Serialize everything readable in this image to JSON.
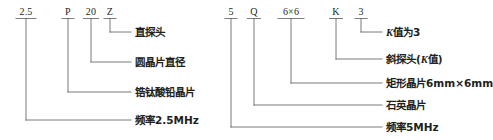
{
  "figure": {
    "type": "ultrasonic-probe-model-designation-diagram",
    "background_color": "#ffffff",
    "line_color": "#58595b",
    "text_color": "#231f20"
  },
  "diagrams": [
    {
      "id": "left",
      "name": "straight-probe-designation",
      "code_tokens": [
        {
          "text": "2.5",
          "x": 26,
          "y": 6,
          "underline_width": 20,
          "tick_x": 26
        },
        {
          "text": "P",
          "x": 68,
          "y": 6,
          "underline_width": 12,
          "tick_x": 68
        },
        {
          "text": "20",
          "x": 91,
          "y": 6,
          "underline_width": 15,
          "tick_x": 91
        },
        {
          "text": "Z",
          "x": 110,
          "y": 6,
          "underline_width": 12,
          "tick_x": 110
        }
      ],
      "callouts": [
        {
          "name": "straight-probe",
          "text": "直探头",
          "label_x": 135,
          "label_y": 26,
          "tick_x": 110,
          "elbow_y": 32,
          "line_end_x": 131
        },
        {
          "name": "round-wafer-diameter",
          "text": "圆晶片直径",
          "label_x": 135,
          "label_y": 56,
          "tick_x": 91,
          "elbow_y": 62,
          "line_end_x": 131
        },
        {
          "name": "lead-zirconate-titanate-wafer",
          "text": "锆钛酸铅晶片",
          "label_x": 135,
          "label_y": 86,
          "tick_x": 68,
          "elbow_y": 92,
          "line_end_x": 131
        },
        {
          "name": "frequency-2p5mhz",
          "text": "频率2.5MHz",
          "label_x": 135,
          "label_y": 114,
          "tick_x": 26,
          "elbow_y": 120,
          "line_end_x": 131
        }
      ]
    },
    {
      "id": "right",
      "name": "angle-probe-designation",
      "code_tokens": [
        {
          "text": "5",
          "x": 231,
          "y": 6,
          "underline_width": 12,
          "tick_x": 231
        },
        {
          "text": "Q",
          "x": 254,
          "y": 6,
          "underline_width": 13,
          "tick_x": 254
        },
        {
          "text": "6×6",
          "x": 291,
          "y": 6,
          "underline_width": 26,
          "tick_x": 291
        },
        {
          "text": "K",
          "x": 336,
          "y": 6,
          "underline_width": 13,
          "tick_x": 336
        },
        {
          "text": "3",
          "x": 361,
          "y": 6,
          "underline_width": 12,
          "tick_x": 361
        }
      ],
      "callouts": [
        {
          "name": "k-value-is-3",
          "text": "K值为3",
          "italic_prefix": "K",
          "rest": "值为3",
          "label_x": 386,
          "label_y": 26,
          "tick_x": 361,
          "elbow_y": 32,
          "line_end_x": 382
        },
        {
          "name": "angle-probe-k-value",
          "text": "斜探头(K值)",
          "label_x": 386,
          "label_y": 53,
          "tick_x": 336,
          "elbow_y": 59,
          "line_end_x": 382
        },
        {
          "name": "rectangular-wafer-6mm",
          "text": "矩形晶片6mm×6mm",
          "label_x": 386,
          "label_y": 77,
          "tick_x": 291,
          "elbow_y": 83,
          "line_end_x": 382
        },
        {
          "name": "quartz-wafer",
          "text": "石英晶片",
          "label_x": 386,
          "label_y": 99,
          "tick_x": 254,
          "elbow_y": 105,
          "line_end_x": 382
        },
        {
          "name": "frequency-5mhz",
          "text": "频率5MHz",
          "label_x": 386,
          "label_y": 121,
          "tick_x": 231,
          "elbow_y": 127,
          "line_end_x": 382
        }
      ]
    }
  ]
}
